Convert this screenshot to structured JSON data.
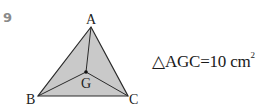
{
  "problem": {
    "number": "9"
  },
  "figure": {
    "type": "triangle-with-centroid",
    "fill_color": "#c9c9c9",
    "stroke_color": "#2a2a2a",
    "vertices": {
      "A": {
        "label": "A",
        "x": 91,
        "y": 27
      },
      "B": {
        "label": "B",
        "x": 38,
        "y": 96
      },
      "C": {
        "label": "C",
        "x": 128,
        "y": 96
      },
      "G": {
        "label": "G",
        "x": 86,
        "y": 72
      }
    }
  },
  "equation": {
    "triangle_symbol": "△",
    "name": "AGC",
    "equals": "=",
    "value": "10",
    "unit": "cm",
    "exponent": "2"
  }
}
